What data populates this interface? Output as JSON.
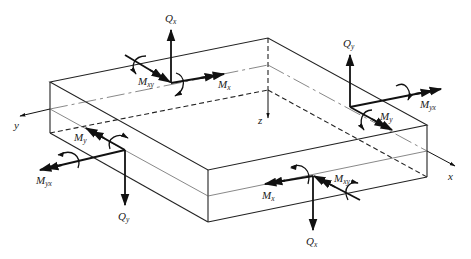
{
  "figure": {
    "axes": {
      "x": "x",
      "y": "y",
      "z": "z"
    },
    "labels": {
      "qx_top": {
        "main": "Q",
        "sub": "x"
      },
      "mxy_top": {
        "main": "M",
        "sub": "xy"
      },
      "mx_top": {
        "main": "M",
        "sub": "x"
      },
      "qy_right": {
        "main": "Q",
        "sub": "y"
      },
      "myx_right": {
        "main": "M",
        "sub": "yx"
      },
      "my_right": {
        "main": "M",
        "sub": "y"
      },
      "my_left": {
        "main": "M",
        "sub": "y"
      },
      "myx_left": {
        "main": "M",
        "sub": "yx"
      },
      "qy_left": {
        "main": "Q",
        "sub": "y"
      },
      "mx_bottom": {
        "main": "M",
        "sub": "x"
      },
      "mxy_bottom": {
        "main": "M",
        "sub": "xy"
      },
      "qx_bottom": {
        "main": "Q",
        "sub": "x"
      }
    }
  }
}
